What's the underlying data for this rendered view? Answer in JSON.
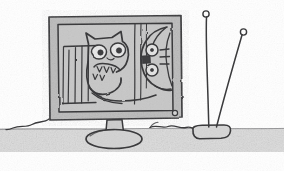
{
  "artwork": {
    "title": "Hand-drawn sketch of a computer monitor with two cartoon creature faces and a TV antenna",
    "medium": "pencil sketch",
    "caption": "",
    "visible_text": ""
  },
  "canvas": {
    "width": 284,
    "height": 171,
    "background_color": "#ffffff"
  },
  "palette": {
    "paper": "#ffffff",
    "ink": "#3a3a3c",
    "ink_light": "#55555a",
    "ground_gray": "#dcdcdc",
    "screen_gray": "#c9c9c9",
    "bezel_gray": "#bdbdbd",
    "pupil_dark": "#3f3f42"
  },
  "ground": {
    "label": "ground surface band",
    "color": "#dcdcdc",
    "top_y": 128,
    "height": 24
  },
  "monitor": {
    "label": "computer monitor",
    "bezel": {
      "x": 48,
      "y": 15,
      "width": 134,
      "height": 105,
      "color": "#bdbdbd"
    },
    "screen": {
      "label": "monitor screen",
      "x": 57,
      "y": 23,
      "width": 116,
      "height": 89,
      "color": "#c9c9c9"
    },
    "power_led": {
      "label": "power indicator light",
      "cx": 175,
      "cy": 113,
      "r": 2.4
    },
    "neck": {
      "label": "monitor stand neck",
      "x": 106,
      "y": 120,
      "width": 16,
      "height": 16
    },
    "base": {
      "label": "monitor stand base",
      "cx": 114,
      "cy": 139,
      "rx": 28,
      "ry": 9
    }
  },
  "creature_left": {
    "label": "cat face creature",
    "features": [
      "pointed ears",
      "two round eyes with pupils",
      "open mouth with teeth",
      "long curving tongue"
    ],
    "eyes": [
      {
        "cx": 99,
        "cy": 52,
        "rx": 7.5,
        "ry": 7.0,
        "pupil_r": 2.6
      },
      {
        "cx": 118,
        "cy": 50,
        "rx": 7.5,
        "ry": 7.0,
        "pupil_r": 2.6
      }
    ]
  },
  "creature_right": {
    "label": "round face creature",
    "features": [
      "rounded head",
      "two stacked round eyes with dots",
      "dark cheek patch",
      "three whisker lines"
    ],
    "eyes": [
      {
        "cx": 152,
        "cy": 50,
        "r": 5.8,
        "pupil_r": 1.5
      },
      {
        "cx": 152,
        "cy": 70,
        "r": 5.8,
        "pupil_r": 1.5
      }
    ],
    "whisker_count": 3
  },
  "screen_bars": {
    "label": "vertical cage bars behind left creature",
    "count": 4
  },
  "screen_lines_right": {
    "label": "vertical streak lines behind right creature",
    "count": 3
  },
  "antenna": {
    "label": "television antenna",
    "base": {
      "label": "antenna base block",
      "x": 192,
      "y": 127,
      "width": 38,
      "height": 14
    },
    "rods": [
      {
        "label": "left antenna rod",
        "tip_x": 206,
        "tip_y": 14,
        "base_x": 209,
        "base_y": 128,
        "loop_r": 3.0
      },
      {
        "label": "right antenna rod",
        "tip_x": 243,
        "tip_y": 32,
        "base_x": 216,
        "base_y": 128,
        "loop_r": 3.0
      }
    ]
  },
  "cables": [
    {
      "label": "left power cable",
      "from": "monitor-left-side",
      "to": "ground-left"
    },
    {
      "label": "right signal cable",
      "from": "monitor-right-side",
      "to": "antenna-base"
    }
  ]
}
